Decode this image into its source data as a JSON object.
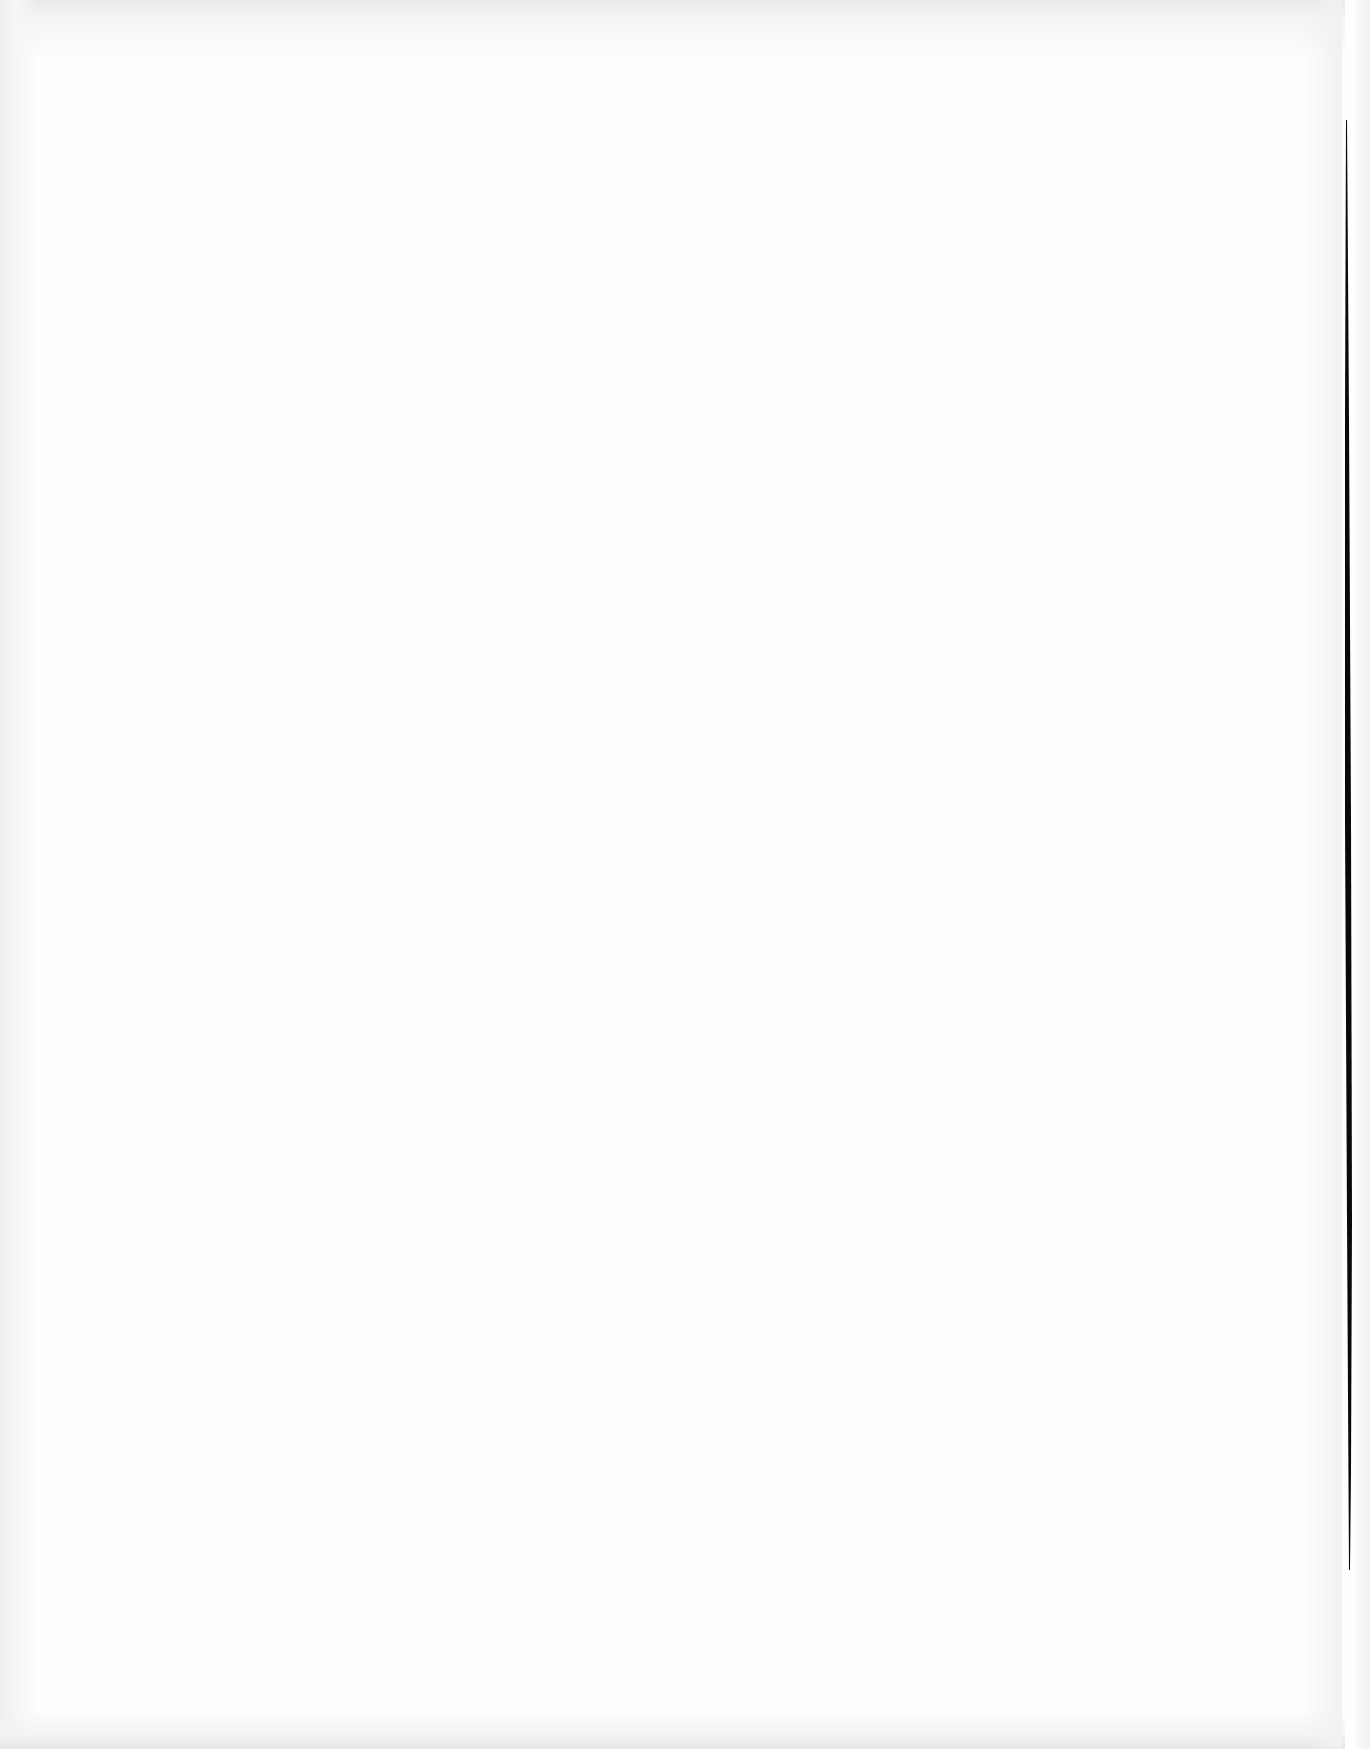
{
  "document": {
    "type": "scanned-page",
    "state": "blank",
    "content": ""
  },
  "colors": {
    "paper": "#fefefe",
    "vignette": "#e9e9e9",
    "binding_line": "#0a0a0a"
  }
}
